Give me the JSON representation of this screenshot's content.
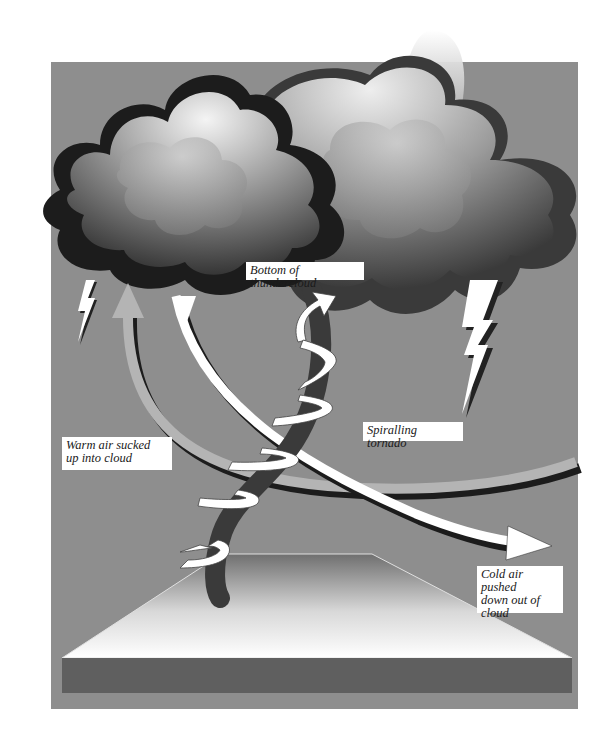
{
  "diagram": {
    "labels": {
      "bottom_of_cloud": "Bottom of thundercloud",
      "warm_air": "Warm air sucked\nup into cloud",
      "spiralling_tornado": "Spiralling tornado",
      "cold_air": "Cold air pushed\ndown out of\ncloud"
    },
    "elements": [
      {
        "name": "thundercloud",
        "description": "large grey cumulonimbus cloud mass"
      },
      {
        "name": "lightning-bolt-left",
        "description": "small white lightning bolt under left cloud"
      },
      {
        "name": "lightning-bolt-right",
        "description": "large white lightning bolt under right cloud"
      },
      {
        "name": "tornado-funnel",
        "description": "dark vertical column wrapped by white spiral ribbon"
      },
      {
        "name": "warm-air-arrow",
        "description": "light grey curved arrow sweeping up into cloud"
      },
      {
        "name": "cold-air-arrow",
        "description": "white curved arrow coming down out of cloud to the right"
      },
      {
        "name": "ground-slab",
        "description": "white gradient trapezoid ground with dark grey front edge"
      }
    ],
    "colors": {
      "background_panel": "#8e8e8e",
      "page": "#ffffff",
      "cloud_dark": "#1c1c1c",
      "cloud_light": "#e6e6e6",
      "tornado": "#3a3a3a",
      "arrow_warm": "#b4b4b4",
      "arrow_cold": "#ffffff",
      "ground_top": "#ffffff",
      "ground_front": "#5f5f5f"
    }
  }
}
